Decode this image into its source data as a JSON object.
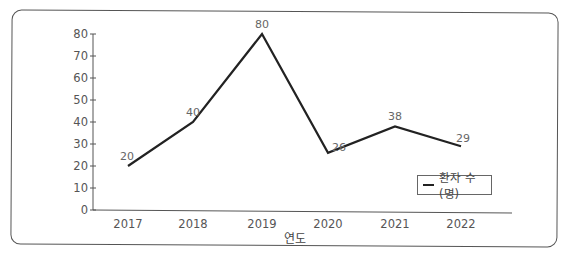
{
  "chart_data": {
    "type": "line",
    "title": "",
    "xlabel": "연도",
    "ylabel": "",
    "categories": [
      "2017",
      "2018",
      "2019",
      "2020",
      "2021",
      "2022"
    ],
    "series": [
      {
        "name": "환자 수(명)",
        "values": [
          20,
          40,
          80,
          26,
          38,
          29
        ],
        "color": "#222222"
      }
    ],
    "data_labels": [
      "20",
      "40",
      "80",
      "26",
      "38",
      "29"
    ],
    "yticks": [
      "0",
      "10",
      "20",
      "30",
      "40",
      "50",
      "60",
      "70",
      "80"
    ],
    "ylim": [
      0,
      80
    ],
    "grid": false,
    "legend_position": "lower-right"
  },
  "legend": {
    "label": "환자 수(명)"
  },
  "axis": {
    "xlabel": "연도"
  }
}
